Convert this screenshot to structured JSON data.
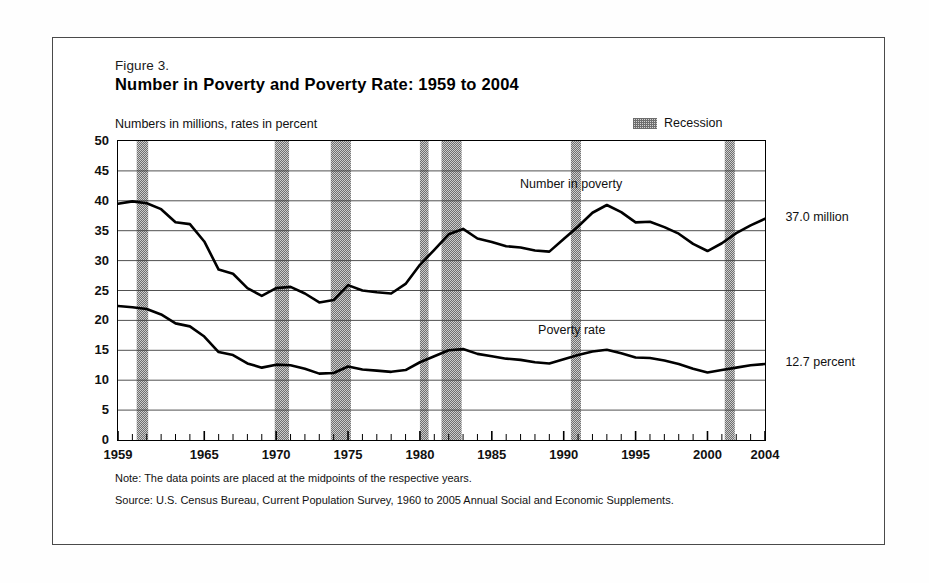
{
  "figure": {
    "number": "Figure 3.",
    "title": "Number in Poverty and Poverty Rate:  1959 to 2004",
    "units_label": "Numbers in millions, rates in percent",
    "legend": {
      "swatch_name": "recession-swatch",
      "label": "Recession"
    },
    "note": "Note:  The data points are placed at the midpoints of the respective years.",
    "source": "Source: U.S. Census Bureau, Current Population Survey, 1960 to 2005 Annual Social and Economic Supplements.",
    "callouts": {
      "number_value": "37.0 million",
      "rate_value": "12.7 percent"
    },
    "series_labels": {
      "number": "Number in poverty",
      "rate": "Poverty rate"
    },
    "colors": {
      "line": "#000000",
      "recession_band": "#8a8a8a",
      "grid": "#555555",
      "axis": "#000000",
      "background": "#ffffff"
    }
  },
  "chart_data": {
    "type": "line",
    "title": "Number in Poverty and Poverty Rate:  1959 to 2004",
    "subtitle": "Numbers in millions, rates in percent",
    "xlabel": "",
    "ylabel": "",
    "xlim": [
      1959,
      2004
    ],
    "ylim": [
      0,
      50
    ],
    "ytick_step": 5,
    "yticks": [
      0,
      5,
      10,
      15,
      20,
      25,
      30,
      35,
      40,
      45,
      50
    ],
    "xticks": [
      1959,
      1965,
      1970,
      1975,
      1980,
      1985,
      1990,
      1995,
      2000,
      2004
    ],
    "xtick_labels": [
      "1959",
      "1965",
      "1970",
      "1975",
      "1980",
      "1985",
      "1990",
      "1995",
      "2000",
      "2004"
    ],
    "grid": true,
    "legend_position": "top-right",
    "x": [
      1959,
      1960,
      1961,
      1962,
      1963,
      1964,
      1965,
      1966,
      1967,
      1968,
      1969,
      1970,
      1971,
      1972,
      1973,
      1974,
      1975,
      1976,
      1977,
      1978,
      1979,
      1980,
      1981,
      1982,
      1983,
      1984,
      1985,
      1986,
      1987,
      1988,
      1989,
      1990,
      1991,
      1992,
      1993,
      1994,
      1995,
      1996,
      1997,
      1998,
      1999,
      2000,
      2001,
      2002,
      2003,
      2004
    ],
    "series": [
      {
        "name": "Number in poverty",
        "unit": "millions",
        "values": [
          39.5,
          39.9,
          39.6,
          38.6,
          36.4,
          36.1,
          33.2,
          28.5,
          27.8,
          25.4,
          24.1,
          25.4,
          25.6,
          24.5,
          23.0,
          23.4,
          25.9,
          25.0,
          24.7,
          24.5,
          26.1,
          29.3,
          31.8,
          34.4,
          35.3,
          33.7,
          33.1,
          32.4,
          32.2,
          31.7,
          31.5,
          33.6,
          35.7,
          38.0,
          39.3,
          38.1,
          36.4,
          36.5,
          35.6,
          34.5,
          32.8,
          31.6,
          32.9,
          34.6,
          35.9,
          37.0
        ]
      },
      {
        "name": "Poverty rate",
        "unit": "percent",
        "values": [
          22.4,
          22.2,
          21.9,
          21.0,
          19.5,
          19.0,
          17.3,
          14.7,
          14.2,
          12.8,
          12.1,
          12.6,
          12.5,
          11.9,
          11.1,
          11.2,
          12.3,
          11.8,
          11.6,
          11.4,
          11.7,
          13.0,
          14.0,
          15.0,
          15.2,
          14.4,
          14.0,
          13.6,
          13.4,
          13.0,
          12.8,
          13.5,
          14.2,
          14.8,
          15.1,
          14.5,
          13.8,
          13.7,
          13.3,
          12.7,
          11.9,
          11.3,
          11.7,
          12.1,
          12.5,
          12.7
        ]
      }
    ],
    "recession_bands": [
      {
        "start": 1960.3,
        "end": 1961.1
      },
      {
        "start": 1969.9,
        "end": 1970.9
      },
      {
        "start": 1973.8,
        "end": 1975.2
      },
      {
        "start": 1980.0,
        "end": 1980.6
      },
      {
        "start": 1981.5,
        "end": 1982.9
      },
      {
        "start": 1990.5,
        "end": 1991.2
      },
      {
        "start": 2001.2,
        "end": 2001.9
      }
    ],
    "annotations": [
      {
        "text": "Number in poverty",
        "x": 1991,
        "y": 42.0
      },
      {
        "text": "Poverty rate",
        "x": 1991,
        "y": 17.5
      },
      {
        "text": "37.0 million",
        "x": 2005,
        "y": 37.0
      },
      {
        "text": "12.7 percent",
        "x": 2005,
        "y": 12.7
      }
    ]
  }
}
